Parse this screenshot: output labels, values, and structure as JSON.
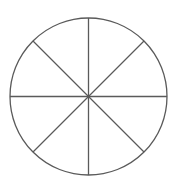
{
  "diagram": {
    "type": "divided-circle",
    "sectors": 8,
    "center": {
      "x": 88.5,
      "y": 96.5
    },
    "radius": 78.5,
    "stroke_color": "#5a5a5a",
    "stroke_width": 1.3,
    "diameter_angles_deg": [
      0,
      45,
      90,
      135
    ],
    "background": "#ffffff"
  }
}
